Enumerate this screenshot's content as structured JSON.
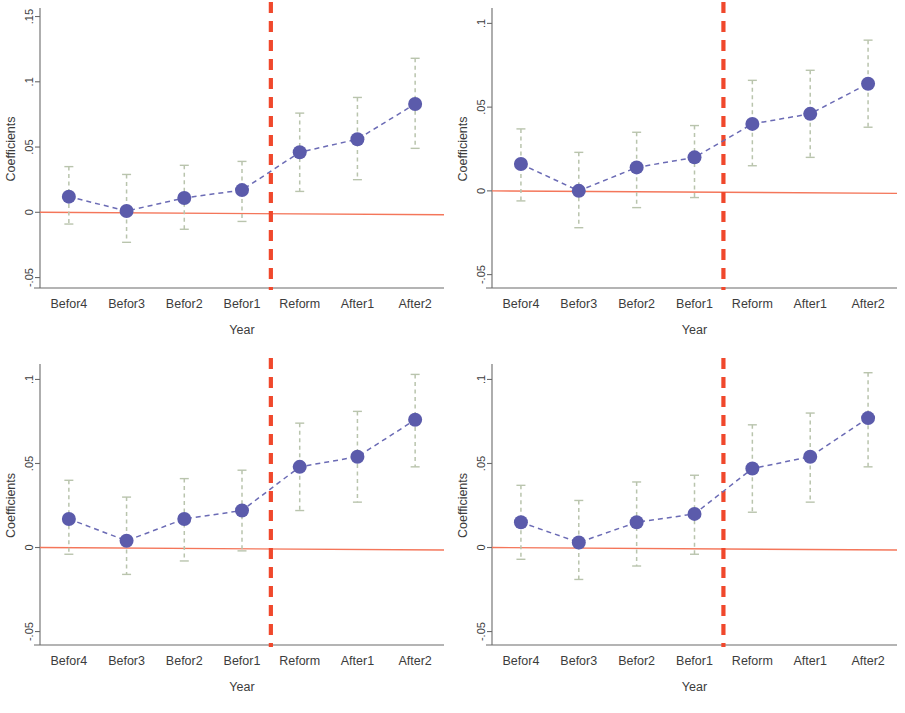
{
  "figure": {
    "panel_count": 4,
    "marker_color": "#5b5bab",
    "series_line_color": "#6b6bb5",
    "ci_color": "#b9c4ad",
    "zero_line_color": "#f4765a",
    "reform_line_color": "#f0482c",
    "axis_color": "#6b6b6b",
    "background": "#ffffff"
  },
  "chart_data": [
    {
      "type": "line",
      "panel": "top-left",
      "title": "",
      "xlabel": "Year",
      "ylabel": "Coefficients",
      "categories": [
        "Befor4",
        "Befor3",
        "Befor2",
        "Befor1",
        "Reform",
        "After1",
        "After2"
      ],
      "yticks": [
        ".15",
        ".1",
        ".05",
        "0",
        "-.05"
      ],
      "ytick_values": [
        0.15,
        0.1,
        0.05,
        0,
        -0.05
      ],
      "ylim": [
        -0.058,
        0.155
      ],
      "grid": false,
      "legend": "none",
      "series": [
        {
          "name": "Coefficient",
          "values": [
            0.012,
            0.001,
            0.011,
            0.017,
            0.046,
            0.056,
            0.083
          ],
          "ci_low": [
            -0.009,
            -0.023,
            -0.013,
            -0.007,
            0.016,
            0.025,
            0.049
          ],
          "ci_high": [
            0.035,
            0.029,
            0.036,
            0.039,
            0.076,
            0.088,
            0.118
          ]
        }
      ],
      "annotations": [
        {
          "name": "reform-line",
          "type": "vline",
          "at_between": [
            "Befor1",
            "Reform"
          ]
        },
        {
          "name": "zero-line",
          "type": "hline",
          "at": 0
        }
      ]
    },
    {
      "type": "line",
      "panel": "top-right",
      "title": "",
      "xlabel": "Year",
      "ylabel": "Coefficients",
      "categories": [
        "Befor4",
        "Befor3",
        "Befor2",
        "Befor1",
        "Reform",
        "After1",
        "After2"
      ],
      "yticks": [
        ".1",
        ".05",
        "0",
        "-.05"
      ],
      "ytick_values": [
        0.1,
        0.05,
        0,
        -0.05
      ],
      "ylim": [
        -0.058,
        0.108
      ],
      "grid": false,
      "legend": "none",
      "series": [
        {
          "name": "Coefficient",
          "values": [
            0.016,
            0.0,
            0.014,
            0.02,
            0.04,
            0.046,
            0.064
          ],
          "ci_low": [
            -0.006,
            -0.022,
            -0.01,
            -0.004,
            0.015,
            0.02,
            0.038
          ],
          "ci_high": [
            0.037,
            0.023,
            0.035,
            0.039,
            0.066,
            0.072,
            0.09
          ]
        }
      ],
      "annotations": [
        {
          "name": "reform-line",
          "type": "vline",
          "at_between": [
            "Befor1",
            "Reform"
          ]
        },
        {
          "name": "zero-line",
          "type": "hline",
          "at": 0
        }
      ]
    },
    {
      "type": "line",
      "panel": "bottom-left",
      "title": "",
      "xlabel": "Year",
      "ylabel": "Coefficients",
      "categories": [
        "Befor4",
        "Befor3",
        "Befor2",
        "Befor1",
        "Reform",
        "After1",
        "After2"
      ],
      "yticks": [
        ".1",
        ".05",
        "0",
        "-.05"
      ],
      "ytick_values": [
        0.1,
        0.05,
        0,
        -0.05
      ],
      "ylim": [
        -0.058,
        0.108
      ],
      "grid": false,
      "legend": "none",
      "series": [
        {
          "name": "Coefficient",
          "values": [
            0.017,
            0.004,
            0.017,
            0.022,
            0.048,
            0.054,
            0.076
          ],
          "ci_low": [
            -0.004,
            -0.016,
            -0.008,
            -0.002,
            0.022,
            0.027,
            0.048
          ],
          "ci_high": [
            0.04,
            0.03,
            0.041,
            0.046,
            0.074,
            0.081,
            0.103
          ]
        }
      ],
      "annotations": [
        {
          "name": "reform-line",
          "type": "vline",
          "at_between": [
            "Befor1",
            "Reform"
          ]
        },
        {
          "name": "zero-line",
          "type": "hline",
          "at": 0
        }
      ]
    },
    {
      "type": "line",
      "panel": "bottom-right",
      "title": "",
      "xlabel": "Year",
      "ylabel": "Coefficients",
      "categories": [
        "Befor4",
        "Befor3",
        "Befor2",
        "Befor1",
        "Reform",
        "After1",
        "After2"
      ],
      "yticks": [
        ".1",
        ".05",
        "0",
        "-.05"
      ],
      "ytick_values": [
        0.1,
        0.05,
        0,
        -0.05
      ],
      "ylim": [
        -0.058,
        0.108
      ],
      "grid": false,
      "legend": "none",
      "series": [
        {
          "name": "Coefficient",
          "values": [
            0.015,
            0.003,
            0.015,
            0.02,
            0.047,
            0.054,
            0.077
          ],
          "ci_low": [
            -0.007,
            -0.019,
            -0.011,
            -0.004,
            0.021,
            0.027,
            0.048
          ],
          "ci_high": [
            0.037,
            0.028,
            0.039,
            0.043,
            0.073,
            0.08,
            0.104
          ]
        }
      ],
      "annotations": [
        {
          "name": "reform-line",
          "type": "vline",
          "at_between": [
            "Befor1",
            "Reform"
          ]
        },
        {
          "name": "zero-line",
          "type": "hline",
          "at": 0
        }
      ]
    }
  ]
}
